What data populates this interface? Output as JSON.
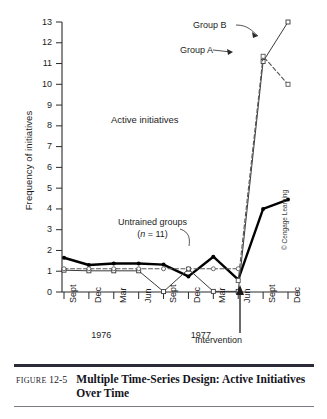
{
  "figure": {
    "label_prefix": "Figure",
    "number": "12-5",
    "caption": "Multiple Time-Series Design: Active Initiatives Over Time",
    "copyright": "© Cengage Learning"
  },
  "annotations": {
    "active_initiatives": "Active initiatives",
    "group_a": "Group A",
    "group_b": "Group B",
    "untrained_line1": "Untrained groups",
    "untrained_line2_pre": "(",
    "untrained_line2_n": "n",
    "untrained_line2_post": " = 11)",
    "intervention": "Intervention"
  },
  "chart_data": {
    "type": "line",
    "title": "Multiple Time-Series Design: Active Initiatives Over Time",
    "xlabel": "",
    "ylabel": "Frequency of initiatives",
    "ylim": [
      0,
      13
    ],
    "yticks": [
      0,
      1,
      2,
      3,
      4,
      5,
      6,
      7,
      8,
      9,
      10,
      11,
      12,
      13
    ],
    "grid": false,
    "legend_position": "in-plot annotations",
    "categories": [
      "Sept",
      "Dec",
      "Mar",
      "Jun",
      "Sept",
      "Dec",
      "Mar",
      "Jun",
      "Sept",
      "Dec"
    ],
    "year_groups": [
      {
        "label": "1976",
        "start_index": 0,
        "end_index": 3
      },
      {
        "label": "1977",
        "start_index": 4,
        "end_index": 7
      }
    ],
    "intervention_marker": {
      "label": "Intervention",
      "at_index": 7.45
    },
    "series": [
      {
        "name": "Group A",
        "style": "solid-thick",
        "color": "#000000",
        "marker": "filled-circle",
        "values": [
          1.65,
          1.3,
          1.37,
          1.37,
          1.32,
          0.75,
          1.7,
          0.6,
          4.0,
          4.45
        ]
      },
      {
        "name": "Group B",
        "style": "solid-thin",
        "color": "#3a3a3a",
        "marker": "open-square",
        "values": [
          1.05,
          1.02,
          1.02,
          1.02,
          0.02,
          1.1,
          0.03,
          0.03,
          11.1,
          13.0
        ]
      },
      {
        "name": "Group A post-intervention (dashed)",
        "style": "dashed",
        "color": "#555555",
        "marker": "open-square",
        "values": [
          null,
          null,
          null,
          null,
          null,
          null,
          null,
          0.55,
          11.35,
          10.0
        ]
      },
      {
        "name": "Untrained groups (n = 11)",
        "style": "dashed-flat",
        "color": "#5a5a5a",
        "marker": "open-circle",
        "values": [
          1.12,
          1.12,
          1.12,
          1.12,
          1.12,
          1.12,
          1.12,
          1.12,
          null,
          null
        ]
      }
    ]
  }
}
